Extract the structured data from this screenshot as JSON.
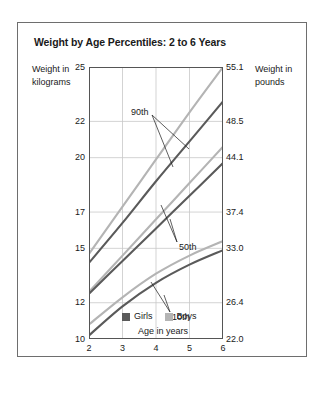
{
  "figure": {
    "title": "Weight by Age Percentiles: 2 to 6 Years",
    "left_axis_title": "Weight in kilograms",
    "right_axis_title": "Weight in pounds",
    "x_axis_title": "Age in years"
  },
  "legend": {
    "items": [
      {
        "label": "Girls",
        "color": "#5a5a5a"
      },
      {
        "label": "Boys",
        "color": "#b4b4b4"
      }
    ]
  },
  "annotations": [
    {
      "label": "90th"
    },
    {
      "label": "50th"
    },
    {
      "label": "10th"
    }
  ],
  "chart_data": {
    "type": "line",
    "title": "Weight by Age Percentiles: 2 to 6 Years",
    "xlabel": "Age in years",
    "ylabel": "Weight in kilograms",
    "ylabel_secondary": "Weight in pounds",
    "xlim": [
      2,
      6
    ],
    "ylim": [
      10,
      25
    ],
    "grid": true,
    "legend_position": "bottom-center",
    "x": [
      2,
      3,
      4,
      5,
      6
    ],
    "xticks": [
      "2",
      "3",
      "4",
      "5",
      "6"
    ],
    "yticks_kg": [
      "10",
      "12",
      "15",
      "17",
      "20",
      "22",
      "25"
    ],
    "yticks_kg_values": [
      10,
      12,
      15,
      17,
      20,
      22,
      25
    ],
    "yticks_lb": [
      "22.0",
      "26.4",
      "33.0",
      "37.4",
      "44.1",
      "48.5",
      "55.1"
    ],
    "yticks_lb_values": [
      22.0,
      26.4,
      33.0,
      37.4,
      44.1,
      48.5,
      55.1
    ],
    "series": [
      {
        "name": "Boys 90th",
        "percentile": "90th",
        "sex": "Boys",
        "color": "#b4b4b4",
        "values": [
          14.7,
          17.3,
          19.9,
          22.5,
          25.0
        ]
      },
      {
        "name": "Girls 90th",
        "percentile": "90th",
        "sex": "Girls",
        "color": "#5a5a5a",
        "values": [
          14.2,
          16.4,
          18.7,
          20.9,
          23.1
        ]
      },
      {
        "name": "Boys 50th",
        "percentile": "50th",
        "sex": "Boys",
        "color": "#b4b4b4",
        "values": [
          12.6,
          14.6,
          16.6,
          18.6,
          20.6
        ]
      },
      {
        "name": "Girls 50th",
        "percentile": "50th",
        "sex": "Girls",
        "color": "#5a5a5a",
        "values": [
          12.5,
          14.3,
          16.1,
          17.9,
          19.7
        ]
      },
      {
        "name": "Boys 10th",
        "percentile": "10th",
        "sex": "Boys",
        "color": "#b4b4b4",
        "values": [
          10.8,
          12.3,
          13.6,
          14.6,
          15.4
        ]
      },
      {
        "name": "Girls 10th",
        "percentile": "10th",
        "sex": "Girls",
        "color": "#5a5a5a",
        "values": [
          10.2,
          11.8,
          13.1,
          14.1,
          14.9
        ]
      }
    ],
    "annotations": [
      {
        "text": "90th",
        "points_to": [
          "Boys 90th",
          "Girls 90th"
        ]
      },
      {
        "text": "50th",
        "points_to": [
          "Boys 50th",
          "Girls 50th"
        ]
      },
      {
        "text": "10th",
        "points_to": [
          "Boys 10th",
          "Girls 10th"
        ]
      }
    ]
  }
}
